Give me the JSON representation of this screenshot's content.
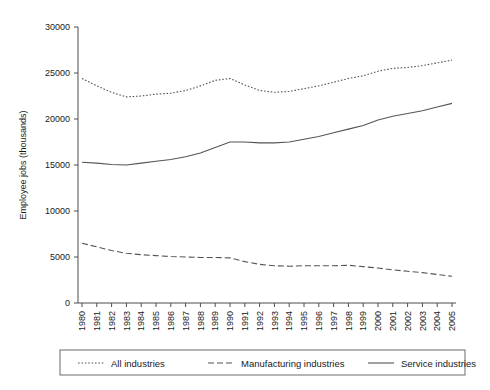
{
  "chart_data": {
    "type": "line",
    "title": "",
    "xlabel": "",
    "ylabel": "Employee jobs (thousands)",
    "xlim": [
      1980,
      2005
    ],
    "ylim": [
      0,
      30000
    ],
    "ytick_values": [
      0,
      5000,
      10000,
      15000,
      20000,
      25000,
      30000
    ],
    "ytick_labels": [
      "0",
      "5000",
      "10000",
      "15000",
      "20000",
      "25000",
      "30000"
    ],
    "grid": false,
    "legend_position": "bottom",
    "x": [
      1980,
      1981,
      1982,
      1983,
      1984,
      1985,
      1986,
      1987,
      1988,
      1989,
      1990,
      1991,
      1992,
      1993,
      1994,
      1995,
      1996,
      1997,
      1998,
      1999,
      2000,
      2001,
      2002,
      2003,
      2004,
      2005
    ],
    "xtick_labels": [
      "1980",
      "1981",
      "1982",
      "1983",
      "1984",
      "1985",
      "1986",
      "1987",
      "1988",
      "1989",
      "1990",
      "1991",
      "1992",
      "1993",
      "1994",
      "1995",
      "1996",
      "1997",
      "1998",
      "1999",
      "2000",
      "2001",
      "2002",
      "2003",
      "2004",
      "2005"
    ],
    "series": [
      {
        "name": "All industries",
        "style": "dotted",
        "values": [
          24400,
          23600,
          22900,
          22400,
          22500,
          22700,
          22800,
          23100,
          23600,
          24200,
          24400,
          23700,
          23100,
          22900,
          23000,
          23300,
          23600,
          24000,
          24400,
          24700,
          25200,
          25500,
          25600,
          25800,
          26100,
          26400
        ]
      },
      {
        "name": "Manufacturing industries",
        "style": "dashed",
        "values": [
          6500,
          6100,
          5700,
          5400,
          5250,
          5150,
          5050,
          5000,
          4950,
          4950,
          4900,
          4500,
          4200,
          4050,
          4000,
          4050,
          4050,
          4050,
          4100,
          3950,
          3800,
          3600,
          3450,
          3300,
          3100,
          2900
        ]
      },
      {
        "name": "Service industries",
        "style": "solid",
        "values": [
          15300,
          15200,
          15050,
          15000,
          15200,
          15400,
          15600,
          15900,
          16300,
          16900,
          17500,
          17500,
          17400,
          17400,
          17500,
          17800,
          18100,
          18500,
          18900,
          19300,
          19900,
          20300,
          20600,
          20900,
          21300,
          21700
        ]
      }
    ]
  },
  "legend": {
    "entries": [
      {
        "label": "All industries",
        "style": "dotted"
      },
      {
        "label": "Manufacturing industries",
        "style": "dashed"
      },
      {
        "label": "Service industries",
        "style": "solid"
      }
    ]
  }
}
